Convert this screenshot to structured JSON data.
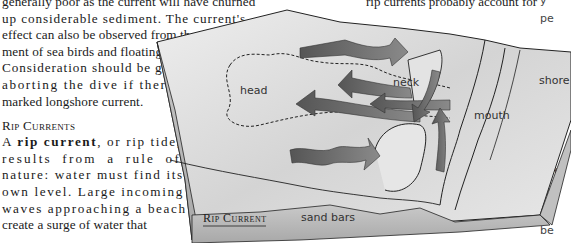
{
  "left_column": {
    "lines_before": [
      "generally poor as the current will have churned",
      "up considerable sediment. The current's",
      "effect can also be observed from the move-",
      "ment of sea birds and floating debris.",
      "Consideration should be given to",
      "aborting the dive if there is a",
      "marked longshore current."
    ],
    "heading": "Rip Currents",
    "para_lead": "A ",
    "para_bold": "rip current",
    "para_rest": ", or rip tide,",
    "lines_after": [
      "results from a rule of",
      "nature: water must find its",
      "own level. Large incoming",
      "waves approaching a beach",
      "create a surge of water that"
    ]
  },
  "top_right_text": "rip currents probably account for",
  "right_fragments": [
    {
      "text": "y",
      "top": -6
    },
    {
      "text": "pe",
      "top": 12
    },
    {
      "text": "c",
      "top": 143
    },
    {
      "text": "stre",
      "top": 164
    },
    {
      "text": "rer",
      "top": 184
    },
    {
      "text": "tra",
      "top": 204
    },
    {
      "text": "be",
      "top": 224
    }
  ],
  "diagram": {
    "title": "Rip Current",
    "labels": {
      "head": "head",
      "neck": "neck",
      "mouth": "mouth",
      "shore": "shore",
      "sand_bars": "sand bars"
    },
    "colors": {
      "water": "#d9d9d9",
      "arrow": "#6e6e6e",
      "side": "#b8b8b8",
      "outline": "#222222"
    }
  }
}
